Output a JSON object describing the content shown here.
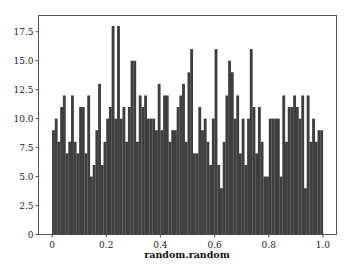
{
  "chart_data": {
    "type": "bar",
    "subtype": "histogram",
    "title": "",
    "xlabel": "random.random",
    "ylabel": "",
    "xlim": [
      -0.05,
      1.05
    ],
    "ylim": [
      0,
      18.9
    ],
    "grid": false,
    "legend": null,
    "bins": 100,
    "bin_range": [
      0,
      1
    ],
    "bar_color": "#3f3f3f",
    "xticks": [
      0,
      0.2,
      0.4,
      0.6,
      0.8,
      1.0
    ],
    "xtick_labels": [
      "0",
      "0.2",
      "0.4",
      "0.6",
      "0.8",
      "1.0"
    ],
    "yticks": [
      0,
      2.5,
      5.0,
      7.5,
      10.0,
      12.5,
      15.0,
      17.5
    ],
    "ytick_labels": [
      "0",
      "2.5",
      "5.0",
      "7.5",
      "10.0",
      "12.5",
      "15.0",
      "17.5"
    ],
    "values": [
      9,
      10,
      8,
      11,
      12,
      7,
      8,
      12,
      8,
      7,
      11,
      11,
      7,
      12,
      5,
      6,
      9,
      13,
      6,
      8,
      10,
      11,
      18,
      10,
      18,
      10,
      11,
      8,
      11,
      15,
      15,
      8,
      12,
      11,
      12,
      10,
      10,
      10,
      9,
      13,
      9,
      12,
      12,
      8,
      9,
      9,
      11,
      12,
      13,
      8,
      14,
      16,
      7,
      7,
      11,
      9,
      10,
      8,
      6,
      10,
      16,
      6,
      4,
      8,
      12,
      15,
      14,
      10,
      12,
      7,
      10,
      6,
      10,
      16,
      11,
      7,
      11,
      8,
      5,
      5,
      10,
      10,
      10,
      10,
      5,
      12,
      8,
      11,
      11,
      12,
      11,
      10,
      12,
      4,
      12,
      8,
      10,
      8,
      9,
      9
    ]
  }
}
